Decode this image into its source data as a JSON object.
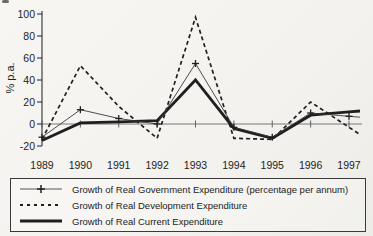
{
  "figure": {
    "background": "#f5f4f0",
    "ink": "#1f1f1f"
  },
  "chart_data": {
    "type": "line",
    "title": "",
    "xlabel": "",
    "ylabel": "% p.a.",
    "categories": [
      "1989",
      "1990",
      "1991",
      "1992",
      "1993",
      "1994",
      "1995",
      "1996",
      "1997"
    ],
    "ylim": [
      -20,
      100
    ],
    "yticks": [
      -20,
      0,
      20,
      40,
      60,
      80,
      100
    ],
    "grid": false,
    "legend_position": "bottom",
    "series": [
      {
        "name": "Growth of Real Government Expenditure (percentage per annum)",
        "style": "thin-plus",
        "marker": "plus",
        "values": [
          -12,
          13,
          5,
          0,
          55,
          -3,
          -12,
          10,
          7
        ]
      },
      {
        "name": "Growth of Real Development Expenditure",
        "style": "dashed",
        "marker": "none",
        "values": [
          -14,
          53,
          16,
          -13,
          97,
          -13,
          -14,
          20,
          -3
        ]
      },
      {
        "name": "Growth of Real Current Expenditure",
        "style": "thick",
        "marker": "none",
        "values": [
          -15,
          1,
          2,
          3,
          40,
          -4,
          -13,
          8,
          11
        ]
      }
    ]
  }
}
